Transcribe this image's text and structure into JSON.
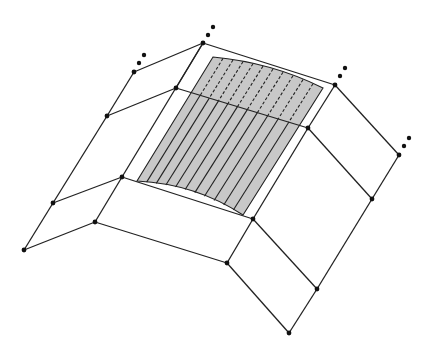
{
  "diagram": {
    "colors": {
      "line": "#222222",
      "shade": "#c8c8c8",
      "node": "#111111",
      "background": "#ffffff"
    },
    "nodes": [
      {
        "id": "A",
        "x": 203,
        "y": 43
      },
      {
        "id": "B",
        "x": 134,
        "y": 72
      },
      {
        "id": "C",
        "x": 176,
        "y": 88
      },
      {
        "id": "D",
        "x": 107,
        "y": 116
      },
      {
        "id": "E",
        "x": 335,
        "y": 85
      },
      {
        "id": "F",
        "x": 399,
        "y": 155
      },
      {
        "id": "G",
        "x": 308,
        "y": 128
      },
      {
        "id": "H",
        "x": 122,
        "y": 177
      },
      {
        "id": "I",
        "x": 53,
        "y": 203
      },
      {
        "id": "J",
        "x": 95,
        "y": 222
      },
      {
        "id": "K",
        "x": 24,
        "y": 250
      },
      {
        "id": "L",
        "x": 253,
        "y": 219
      },
      {
        "id": "M",
        "x": 227,
        "y": 263
      },
      {
        "id": "N",
        "x": 317,
        "y": 289
      },
      {
        "id": "O",
        "x": 289,
        "y": 333
      },
      {
        "id": "P",
        "x": 372,
        "y": 199
      }
    ],
    "edges": [
      [
        "A",
        "B"
      ],
      [
        "B",
        "D"
      ],
      [
        "D",
        "C"
      ],
      [
        "C",
        "A"
      ],
      [
        "A",
        "E"
      ],
      [
        "E",
        "F"
      ],
      [
        "C",
        "G"
      ],
      [
        "E",
        "G"
      ],
      [
        "F",
        "P"
      ],
      [
        "G",
        "P"
      ],
      [
        "A",
        "H"
      ],
      [
        "D",
        "I"
      ],
      [
        "I",
        "K"
      ],
      [
        "I",
        "H"
      ],
      [
        "H",
        "J"
      ],
      [
        "J",
        "K"
      ],
      [
        "H",
        "L"
      ],
      [
        "G",
        "L"
      ],
      [
        "J",
        "M"
      ],
      [
        "L",
        "M"
      ],
      [
        "L",
        "N"
      ],
      [
        "P",
        "N"
      ],
      [
        "M",
        "O"
      ],
      [
        "N",
        "O"
      ]
    ],
    "ellipsis_dots": [
      {
        "near": "A",
        "dots": [
          [
            208,
            35
          ],
          [
            213,
            27
          ]
        ]
      },
      {
        "near": "B",
        "dots": [
          [
            139,
            63
          ],
          [
            144,
            55
          ]
        ]
      },
      {
        "near": "E",
        "dots": [
          [
            340,
            76
          ],
          [
            345,
            68
          ]
        ]
      },
      {
        "near": "F",
        "dots": [
          [
            404,
            146
          ],
          [
            409,
            138
          ]
        ]
      }
    ],
    "shaded_patch": {
      "corners": [
        [
          213,
          57
        ],
        [
          323,
          88
        ],
        [
          243,
          215
        ],
        [
          137,
          181
        ]
      ],
      "hatch_count": 10
    }
  }
}
